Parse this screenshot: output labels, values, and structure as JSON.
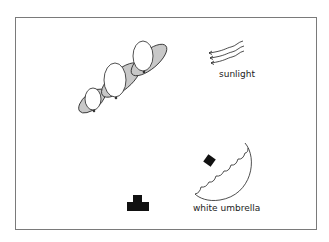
{
  "diagram": {
    "labels": {
      "sunlight": "sunlight",
      "umbrella": "white umbrella"
    },
    "elements": [
      {
        "id": "balloon-group",
        "type": "balloons",
        "count": 3
      },
      {
        "id": "sunlight",
        "type": "wavy-arrows",
        "count": 3,
        "direction": "left-down"
      },
      {
        "id": "umbrella",
        "type": "scalloped-reflector",
        "color": "white"
      },
      {
        "id": "flash",
        "type": "light-head"
      },
      {
        "id": "camera",
        "type": "camera-symbol"
      }
    ],
    "colors": {
      "frame": "#7a7a7a",
      "balloon_fill": "#ffffff",
      "balloon_shadow": "#c8c8c8",
      "ink": "#111111"
    }
  }
}
